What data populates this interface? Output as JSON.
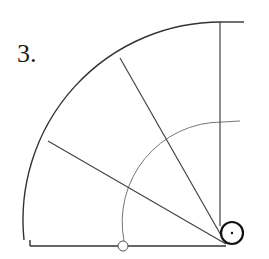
{
  "figure": {
    "label": "3.",
    "label_pos": {
      "x": 17,
      "y": 51
    },
    "colors": {
      "stroke": "#333333",
      "light_stroke": "#777777",
      "background": "#ffffff"
    },
    "pivot": {
      "x": 222,
      "y": 246
    },
    "outer_arc": {
      "radius": 198,
      "start": {
        "x": 24,
        "y": 246
      },
      "end": {
        "x": 222,
        "y": 22
      },
      "tail_end_x": 244
    },
    "inner_arc": {
      "radius": 100,
      "start": {
        "x": 124,
        "y": 246
      },
      "end": {
        "x": 222,
        "y": 122
      },
      "tail_end_x": 240
    },
    "baseline": {
      "x1": 30,
      "y1": 246,
      "x2": 226,
      "y2": 246
    },
    "vertical_line": {
      "x": 220,
      "y1": 22,
      "y2": 246
    },
    "rays": [
      {
        "x1": 226,
        "y1": 244,
        "x2": 120,
        "y2": 58
      },
      {
        "x1": 226,
        "y1": 244,
        "x2": 48,
        "y2": 141
      }
    ],
    "pivot_circle": {
      "cx": 232,
      "cy": 233,
      "r": 11,
      "dot_r": 1.2
    },
    "hinge_circle": {
      "cx": 123,
      "cy": 246,
      "r": 5
    }
  }
}
